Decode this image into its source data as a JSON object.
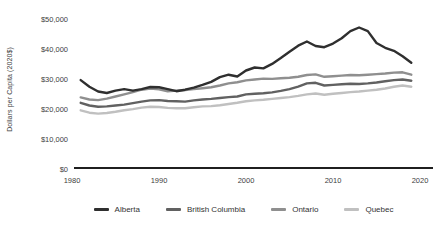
{
  "y_axis": {
    "title": "Dollars per Capita (2020$)",
    "tick_labels": [
      "$50,000",
      "$40,000",
      "$30,000",
      "$20,000",
      "$10,000",
      "$0"
    ]
  },
  "x_axis": {
    "tick_labels": [
      "1980",
      "1990",
      "2000",
      "2010",
      "2020"
    ]
  },
  "legend": {
    "items": [
      {
        "label": "Alberta",
        "color": "#2f2f2f"
      },
      {
        "label": "British Columbia",
        "color": "#616161"
      },
      {
        "label": "Ontario",
        "color": "#8f8f8f"
      },
      {
        "label": "Quebec",
        "color": "#c0c0c0"
      }
    ]
  },
  "chart_data": {
    "type": "line",
    "title": "",
    "xlabel": "",
    "ylabel": "Dollars per Capita (2020$)",
    "x_range": [
      1980,
      2020
    ],
    "ylim": [
      0,
      50000
    ],
    "grid": false,
    "legend_position": "bottom",
    "x": [
      1981,
      1982,
      1983,
      1984,
      1985,
      1986,
      1987,
      1988,
      1989,
      1990,
      1991,
      1992,
      1993,
      1994,
      1995,
      1996,
      1997,
      1998,
      1999,
      2000,
      2001,
      2002,
      2003,
      2004,
      2005,
      2006,
      2007,
      2008,
      2009,
      2010,
      2011,
      2012,
      2013,
      2014,
      2015,
      2016,
      2017,
      2018,
      2019
    ],
    "series": [
      {
        "name": "Alberta",
        "color": "#2f2f2f",
        "values": [
          29400,
          27200,
          25600,
          25100,
          25900,
          26400,
          25900,
          26400,
          27100,
          27000,
          26400,
          25700,
          26200,
          26900,
          27800,
          28800,
          30400,
          31200,
          30600,
          32600,
          33600,
          33300,
          34800,
          36800,
          38900,
          40900,
          42300,
          40800,
          40400,
          41600,
          43400,
          45800,
          47000,
          45800,
          41800,
          40200,
          39200,
          37400,
          35200
        ]
      },
      {
        "name": "British Columbia",
        "color": "#616161",
        "values": [
          21800,
          20900,
          20500,
          20600,
          20900,
          21200,
          21700,
          22200,
          22600,
          22700,
          22400,
          22300,
          22200,
          22600,
          22900,
          23100,
          23400,
          23700,
          23900,
          24600,
          24800,
          25000,
          25300,
          25800,
          26400,
          27200,
          28300,
          28500,
          27600,
          27800,
          28000,
          28200,
          28100,
          28300,
          28600,
          29000,
          29400,
          29600,
          29200
        ]
      },
      {
        "name": "Ontario",
        "color": "#8f8f8f",
        "values": [
          23600,
          22900,
          22700,
          23200,
          23900,
          24600,
          25400,
          26200,
          26600,
          26300,
          25700,
          25900,
          26100,
          26400,
          26700,
          27000,
          27600,
          28300,
          28700,
          29300,
          29600,
          29900,
          29800,
          30000,
          30200,
          30500,
          31100,
          31300,
          30500,
          30700,
          30900,
          31100,
          31000,
          31200,
          31400,
          31600,
          31900,
          32000,
          31200
        ]
      },
      {
        "name": "Quebec",
        "color": "#c0c0c0",
        "values": [
          19300,
          18500,
          18200,
          18400,
          18800,
          19300,
          19700,
          20200,
          20500,
          20400,
          20100,
          20000,
          20000,
          20300,
          20600,
          20700,
          21000,
          21400,
          21800,
          22300,
          22600,
          22800,
          23100,
          23400,
          23700,
          24100,
          24600,
          24900,
          24500,
          24800,
          25100,
          25400,
          25600,
          25900,
          26200,
          26600,
          27200,
          27600,
          27200
        ]
      }
    ]
  }
}
